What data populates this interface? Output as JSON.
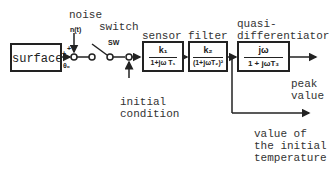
{
  "blocks": {
    "surface": {
      "label": "surface"
    },
    "sensor": {
      "title": "sensor",
      "numerator": "k₁",
      "denominator": "1+jω T₁"
    },
    "filter": {
      "title": "filter",
      "numerator": "k₂",
      "denominator": "(1+jωT₂)²"
    },
    "quasi": {
      "title_line1": "quasi-",
      "title_line2": "differentiator",
      "numerator": "jω",
      "denominator": "1 + jωT₃"
    }
  },
  "labels": {
    "noise": "noise",
    "noise_signal": "n(t)",
    "switch": "switch",
    "sw": "SW",
    "theta": "θ₀",
    "plus1": "+",
    "plus2": "+",
    "initial_condition": "initial\ncondition",
    "peak_value": "peak\nvalue",
    "initial_temp": "value of\nthe initial\ntemperature"
  }
}
